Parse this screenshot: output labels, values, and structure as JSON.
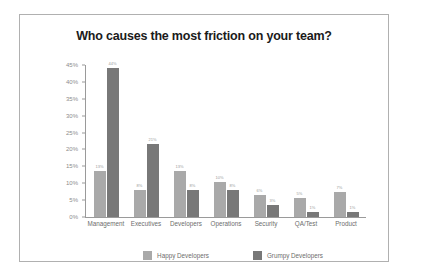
{
  "chart_data": {
    "type": "bar",
    "title": "Who causes the most friction on your team?",
    "xlabel": "",
    "ylabel": "",
    "ylim": [
      0,
      45
    ],
    "grid": false,
    "legend_position": "bottom",
    "categories": [
      "Management",
      "Executives",
      "Developers",
      "Operations",
      "Security",
      "QA/Test",
      "Product"
    ],
    "ytick_labels": [
      "0%",
      "5%",
      "10%",
      "15%",
      "20%",
      "25%",
      "30%",
      "35%",
      "40%",
      "45%"
    ],
    "ytick_values": [
      0,
      5,
      10,
      15,
      20,
      25,
      30,
      35,
      40,
      45
    ],
    "series": [
      {
        "name": "Happy Developers",
        "color": "#a9a9a9",
        "values": [
          13.5,
          8,
          13.5,
          10.5,
          6.5,
          5.5,
          7.5
        ],
        "value_labels": [
          "13%",
          "8%",
          "13%",
          "10%",
          "6%",
          "5%",
          "7%"
        ]
      },
      {
        "name": "Grumpy Developers",
        "color": "#787878",
        "values": [
          44,
          21.5,
          8,
          8,
          3.5,
          1.5,
          1.5
        ],
        "value_labels": [
          "44%",
          "21%",
          "8%",
          "8%",
          "3%",
          "1%",
          "1%"
        ]
      }
    ]
  },
  "colors": {
    "frame_border": "#b0b0b0",
    "axis": "#9a9a9a",
    "title_text": "#1b1b1b",
    "tick_text": "#6d6d6d",
    "background": "#ffffff"
  }
}
